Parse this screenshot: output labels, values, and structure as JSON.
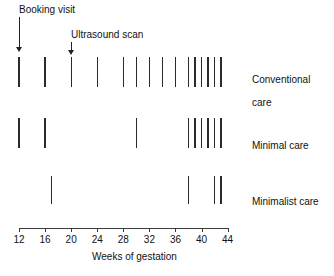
{
  "chart_data": {
    "type": "table",
    "title": "",
    "xlabel": "Weeks of gestation",
    "ylabel": "",
    "xlim": [
      12,
      44
    ],
    "grid": false,
    "legend_position": "right",
    "x_ticks": [
      12,
      16,
      20,
      24,
      28,
      32,
      36,
      40,
      44
    ],
    "x_tick_labels": [
      "12",
      "16",
      "20",
      "24",
      "28",
      "32",
      "36",
      "40",
      "44"
    ],
    "series": [
      {
        "name": "Conventional care",
        "label_lines": [
          "Conventional",
          "care"
        ],
        "visit_weeks": [
          12,
          16,
          20,
          24,
          28,
          30,
          32,
          34,
          36,
          38,
          39,
          40,
          41,
          42,
          43
        ],
        "visit_count": 15
      },
      {
        "name": "Minimal care",
        "label_lines": [
          "Minimal care"
        ],
        "visit_weeks": [
          12,
          16,
          30,
          38,
          39,
          40,
          41,
          42,
          43
        ],
        "visit_count": 9
      },
      {
        "name": "Minimalist care",
        "label_lines": [
          "Minimalist care"
        ],
        "visit_weeks": [
          17,
          38,
          42,
          43
        ],
        "visit_count": 4
      }
    ],
    "annotations": [
      {
        "text": "Booking visit",
        "week": 12
      },
      {
        "text": "Ultrasound scan",
        "week": 20
      }
    ]
  },
  "axis": {
    "title": "Weeks of gestation"
  },
  "annotations": {
    "booking": {
      "text": "Booking visit"
    },
    "ultrasound": {
      "text": "Ultrasound scan"
    }
  },
  "rows": {
    "conventional": {
      "line1": "Conventional",
      "line2": "care"
    },
    "minimal": {
      "line1": "Minimal care"
    },
    "minimalist": {
      "line1": "Minimalist care"
    }
  }
}
